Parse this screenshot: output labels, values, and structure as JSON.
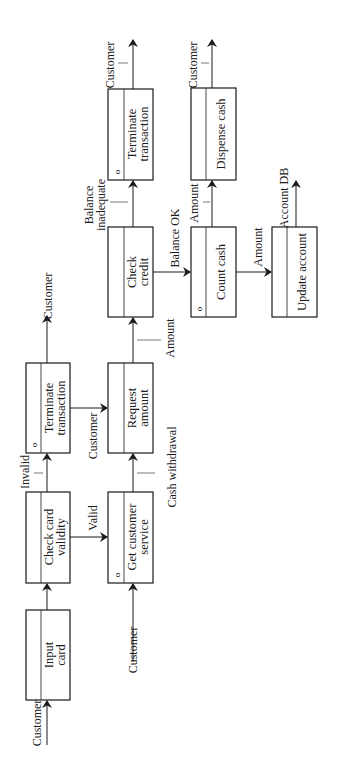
{
  "diagram": {
    "type": "structure-chart / process flow (rotated 90°)",
    "orientation": "rotated -90deg (read bottom-to-top)",
    "boxes": [
      {
        "id": "input-card",
        "line1": "Input",
        "line2": "card",
        "marker": ""
      },
      {
        "id": "check-card-validity",
        "line1": "Check card",
        "line2": "validity",
        "marker": ""
      },
      {
        "id": "terminate-transaction-1",
        "line1": "Terminate",
        "line2": "transaction",
        "marker": "o"
      },
      {
        "id": "get-customer-service",
        "line1": "Get customer",
        "line2": "service",
        "marker": "o"
      },
      {
        "id": "request-amount",
        "line1": "Request",
        "line2": "amount",
        "marker": ""
      },
      {
        "id": "check-credit",
        "line1": "Check",
        "line2": "credit",
        "marker": ""
      },
      {
        "id": "terminate-transaction-2",
        "line1": "Terminate",
        "line2": "transaction",
        "marker": "o"
      },
      {
        "id": "count-cash",
        "line1": "Count cash",
        "line2": "",
        "marker": "o"
      },
      {
        "id": "dispense-cash",
        "line1": "Dispense cash",
        "line2": "",
        "marker": ""
      },
      {
        "id": "update-account",
        "line1": "Update account",
        "line2": "",
        "marker": ""
      }
    ],
    "flows": [
      {
        "from": "external",
        "to": "input-card",
        "label": "Customer"
      },
      {
        "from": "input-card",
        "to": "check-card-validity",
        "label": ""
      },
      {
        "from": "check-card-validity",
        "to": "terminate-transaction-1",
        "label": "Invalid"
      },
      {
        "from": "check-card-validity",
        "to": "get-customer-service",
        "label": "Valid"
      },
      {
        "from": "terminate-transaction-1",
        "to": "external",
        "label": "Customer"
      },
      {
        "from": "terminate-transaction-1",
        "to": "request-amount",
        "label": "Customer"
      },
      {
        "from": "external",
        "to": "get-customer-service",
        "label": "Customer"
      },
      {
        "from": "get-customer-service",
        "to": "request-amount",
        "label": "Cash withdrawal"
      },
      {
        "from": "request-amount",
        "to": "check-credit",
        "label": "Amount"
      },
      {
        "from": "check-credit",
        "to": "terminate-transaction-2",
        "label_line1": "Balance",
        "label_line2": "inadequate"
      },
      {
        "from": "check-credit",
        "to": "count-cash",
        "label": "Balance OK"
      },
      {
        "from": "terminate-transaction-2",
        "to": "external",
        "label": "Customer"
      },
      {
        "from": "count-cash",
        "to": "dispense-cash",
        "label": "Amount"
      },
      {
        "from": "count-cash",
        "to": "update-account",
        "label": "Amount"
      },
      {
        "from": "dispense-cash",
        "to": "external",
        "label": "Customer"
      },
      {
        "from": "update-account",
        "to": "external",
        "label": "Account DB"
      }
    ]
  },
  "labels": {
    "customer_in_input": "Customer",
    "invalid": "Invalid",
    "valid": "Valid",
    "customer_out_term1": "Customer",
    "customer_term1_to_request": "Customer",
    "customer_in_gcs": "Customer",
    "cash_withdrawal": "Cash withdrawal",
    "amount_to_check_credit": "Amount",
    "balance_inadequate_1": "Balance",
    "balance_inadequate_2": "inadequate",
    "balance_ok": "Balance OK",
    "customer_out_term2": "Customer",
    "amount_to_dispense": "Amount",
    "amount_to_update": "Amount",
    "customer_out_dispense": "Customer",
    "account_db": "Account DB",
    "marker": "o"
  }
}
